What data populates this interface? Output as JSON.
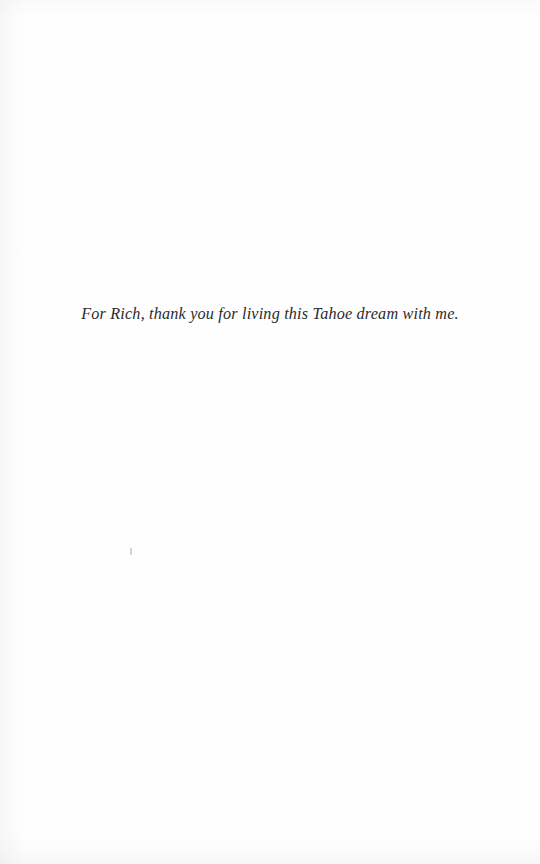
{
  "page": {
    "kind": "book-dedication-page",
    "background_color": "#fefefe",
    "ink_color": "#2b2b2d"
  },
  "dedication": {
    "text": "For Rich, thank you for living this Tahoe dream with me."
  },
  "artifacts": {
    "gutter_shadow_label": "",
    "bottom_shadow_label": "",
    "top_shadow_label": "",
    "speck_label": ""
  }
}
